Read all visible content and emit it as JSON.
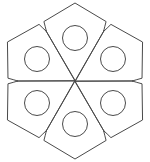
{
  "canvas": {
    "width": 150,
    "height": 162,
    "background_color": "#ffffff",
    "title": "Six-petal flower rosette line drawing"
  },
  "artwork": {
    "name": "six-petal-rosette",
    "style": "line-art-outline",
    "stroke_color": "#4a4a4a",
    "stroke_width": 1,
    "fill": "none",
    "petal_count": 6,
    "center": {
      "x": 75,
      "y": 81
    },
    "ring_radius": 12.5,
    "ring_inset_from_center": 43,
    "petal_tip_distance": 78,
    "petal_shoulder_distance": 52,
    "petal_half_angle_deg": 30,
    "petals": [
      {
        "label": "petal-top",
        "angle_deg": 270,
        "tip": {
          "x": 75,
          "y": 4
        },
        "ring_center": {
          "x": 75,
          "y": 38
        }
      },
      {
        "label": "petal-upper-right",
        "angle_deg": 330,
        "tip": {
          "x": 143,
          "y": 42
        },
        "ring_center": {
          "x": 113,
          "y": 59
        }
      },
      {
        "label": "petal-lower-right",
        "angle_deg": 30,
        "tip": {
          "x": 143,
          "y": 120
        },
        "ring_center": {
          "x": 113,
          "y": 103
        }
      },
      {
        "label": "petal-bottom",
        "angle_deg": 90,
        "tip": {
          "x": 75,
          "y": 158
        },
        "ring_center": {
          "x": 75,
          "y": 124
        }
      },
      {
        "label": "petal-lower-left",
        "angle_deg": 150,
        "tip": {
          "x": 7,
          "y": 120
        },
        "ring_center": {
          "x": 37,
          "y": 103
        }
      },
      {
        "label": "petal-upper-left",
        "angle_deg": 210,
        "tip": {
          "x": 7,
          "y": 42
        },
        "ring_center": {
          "x": 37,
          "y": 59
        }
      }
    ]
  }
}
